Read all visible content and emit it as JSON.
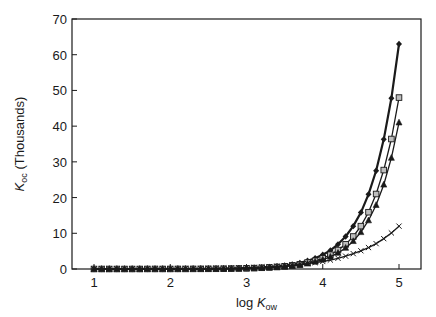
{
  "chart_data": {
    "type": "line",
    "title": "",
    "xlabel": "log K_ow",
    "ylabel": "K_oc (Thousands)",
    "xlabel_parts": {
      "pre": "log ",
      "italic": "K",
      "sub": "ow"
    },
    "ylabel_parts": {
      "italic": "K",
      "sub": "oc",
      "post": " (Thousands)"
    },
    "xlim": [
      0.7,
      5.3
    ],
    "ylim": [
      0,
      70
    ],
    "xticks": [
      1,
      2,
      3,
      4,
      5
    ],
    "yticks": [
      0,
      10,
      20,
      30,
      40,
      50,
      60,
      70
    ],
    "grid": false,
    "legend": "none",
    "x": [
      1.0,
      1.1,
      1.2,
      1.3,
      1.4,
      1.5,
      1.6,
      1.7,
      1.8,
      1.9,
      2.0,
      2.1,
      2.2,
      2.3,
      2.4,
      2.5,
      2.6,
      2.7,
      2.8,
      2.9,
      3.0,
      3.1,
      3.2,
      3.3,
      3.4,
      3.5,
      3.6,
      3.7,
      3.8,
      3.9,
      4.0,
      4.1,
      4.2,
      4.3,
      4.4,
      4.5,
      4.6,
      4.7,
      4.8,
      4.9,
      5.0
    ],
    "series": [
      {
        "name": "series-diamond",
        "marker": "diamond",
        "line_width": 2.2,
        "values": [
          0.0,
          0.0,
          0.0,
          0.0,
          0.0,
          0.0,
          0.01,
          0.01,
          0.01,
          0.01,
          0.02,
          0.02,
          0.03,
          0.04,
          0.05,
          0.06,
          0.08,
          0.11,
          0.14,
          0.19,
          0.25,
          0.33,
          0.44,
          0.58,
          0.76,
          1.0,
          1.3,
          1.7,
          2.3,
          3.0,
          4.0,
          5.2,
          6.9,
          9.1,
          12.0,
          15.8,
          20.9,
          27.5,
          36.3,
          47.8,
          63.0
        ]
      },
      {
        "name": "series-square",
        "marker": "square",
        "line_width": 1.3,
        "values": [
          0.0,
          0.0,
          0.0,
          0.0,
          0.0,
          0.0,
          0.0,
          0.01,
          0.01,
          0.01,
          0.01,
          0.02,
          0.02,
          0.03,
          0.04,
          0.05,
          0.06,
          0.08,
          0.11,
          0.14,
          0.19,
          0.25,
          0.34,
          0.44,
          0.58,
          0.76,
          1.0,
          1.3,
          1.8,
          2.3,
          3.0,
          4.0,
          5.3,
          6.9,
          9.1,
          12.0,
          15.9,
          21.0,
          27.7,
          36.4,
          48.0
        ]
      },
      {
        "name": "series-triangle",
        "marker": "triangle",
        "line_width": 1.3,
        "values": [
          0.0,
          0.0,
          0.0,
          0.0,
          0.0,
          0.0,
          0.0,
          0.01,
          0.01,
          0.01,
          0.01,
          0.02,
          0.02,
          0.03,
          0.03,
          0.04,
          0.05,
          0.07,
          0.09,
          0.12,
          0.16,
          0.21,
          0.29,
          0.38,
          0.49,
          0.65,
          0.85,
          1.1,
          1.5,
          2.0,
          2.6,
          3.4,
          4.5,
          5.9,
          7.8,
          10.3,
          13.6,
          17.9,
          23.6,
          31.1,
          41.0
        ]
      },
      {
        "name": "series-cross",
        "marker": "cross",
        "line_width": 1.3,
        "values": [
          0.01,
          0.02,
          0.02,
          0.02,
          0.03,
          0.03,
          0.04,
          0.04,
          0.05,
          0.06,
          0.07,
          0.08,
          0.09,
          0.11,
          0.13,
          0.16,
          0.19,
          0.23,
          0.27,
          0.32,
          0.38,
          0.45,
          0.54,
          0.64,
          0.76,
          0.9,
          1.1,
          1.3,
          1.5,
          1.8,
          2.1,
          2.5,
          3.0,
          3.6,
          4.3,
          5.1,
          6.0,
          7.1,
          8.5,
          10.1,
          12.0
        ]
      }
    ]
  },
  "colors": {
    "ink": "#1a1a1a",
    "square_fill": "#bdbdbd",
    "background": "#ffffff"
  }
}
